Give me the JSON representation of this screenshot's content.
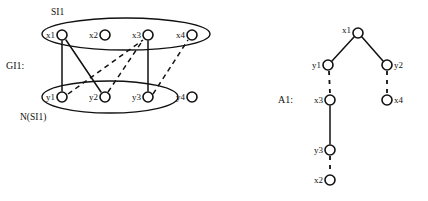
{
  "figure": {
    "background_color": "#ffffff",
    "ink_color": "#111111",
    "panels": [
      {
        "id": "bipartite",
        "label": "GI1:",
        "groups": [
          {
            "id": "top-set",
            "label": "SI1",
            "members": [
              "x1",
              "x2",
              "x3"
            ]
          },
          {
            "id": "bottom-set",
            "label": "N(SI1)",
            "members": [
              "y1",
              "y2",
              "y3"
            ]
          }
        ],
        "nodes": [
          {
            "id": "x1",
            "label": "x1",
            "x": 62,
            "y": 35,
            "label_side": "left"
          },
          {
            "id": "x2",
            "label": "x2",
            "x": 105,
            "y": 35,
            "label_side": "left"
          },
          {
            "id": "x3",
            "label": "x3",
            "x": 148,
            "y": 35,
            "label_side": "left"
          },
          {
            "id": "x4",
            "label": "x4",
            "x": 192,
            "y": 35,
            "label_side": "left"
          },
          {
            "id": "y1",
            "label": "y1",
            "x": 62,
            "y": 97,
            "label_side": "left"
          },
          {
            "id": "y2",
            "label": "y2",
            "x": 105,
            "y": 97,
            "label_side": "left"
          },
          {
            "id": "y3",
            "label": "y3",
            "x": 148,
            "y": 97,
            "label_side": "left"
          },
          {
            "id": "y4",
            "label": "y4",
            "x": 192,
            "y": 97,
            "label_side": "left"
          }
        ],
        "edges": [
          {
            "from": "x1",
            "to": "y1",
            "style": "solid"
          },
          {
            "from": "x1",
            "to": "y2",
            "style": "solid"
          },
          {
            "from": "x3",
            "to": "y3",
            "style": "solid"
          },
          {
            "from": "y1",
            "to": "x3",
            "style": "dashed"
          },
          {
            "from": "y2",
            "to": "x2",
            "style": "dashed"
          },
          {
            "from": "y3",
            "to": "x4",
            "style": "dashed"
          }
        ]
      },
      {
        "id": "alternating-tree",
        "label": "A1:",
        "nodes": [
          {
            "id": "t-x1",
            "label": "x1",
            "x": 358,
            "y": 33,
            "label_side": "left"
          },
          {
            "id": "t-y1",
            "label": "y1",
            "x": 328,
            "y": 65,
            "label_side": "left"
          },
          {
            "id": "t-y2",
            "label": "y2",
            "x": 387,
            "y": 65,
            "label_side": "right"
          },
          {
            "id": "t-x3",
            "label": "x3",
            "x": 330,
            "y": 100,
            "label_side": "left"
          },
          {
            "id": "t-x4",
            "label": "x4",
            "x": 387,
            "y": 100,
            "label_side": "right"
          },
          {
            "id": "t-y3",
            "label": "y3",
            "x": 330,
            "y": 150,
            "label_side": "left"
          },
          {
            "id": "t-x2",
            "label": "x2",
            "x": 330,
            "y": 180,
            "label_side": "left"
          }
        ],
        "edges": [
          {
            "from": "t-x1",
            "to": "t-y1",
            "style": "solid"
          },
          {
            "from": "t-x1",
            "to": "t-y2",
            "style": "solid"
          },
          {
            "from": "t-y1",
            "to": "t-x3",
            "style": "dashed"
          },
          {
            "from": "t-y2",
            "to": "t-x4",
            "style": "dashed"
          },
          {
            "from": "t-x3",
            "to": "t-y3",
            "style": "solid"
          },
          {
            "from": "t-y3",
            "to": "t-x2",
            "style": "dashed"
          }
        ]
      }
    ]
  }
}
